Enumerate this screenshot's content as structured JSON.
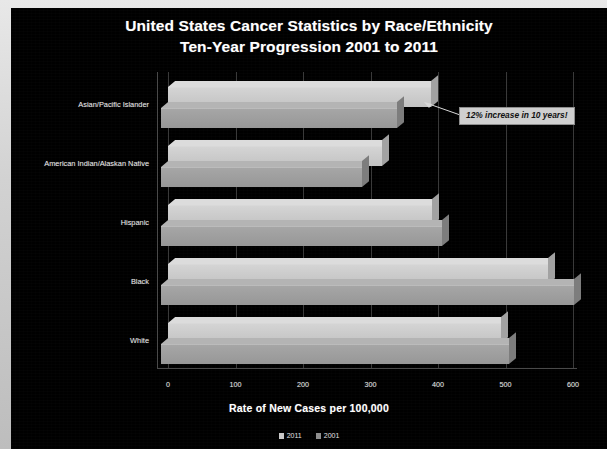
{
  "chart_data": {
    "type": "bar",
    "orientation": "horizontal",
    "title": "United States Cancer Statistics by Race/Ethnicity",
    "subtitle": "Ten-Year Progression 2001 to 2011",
    "xlabel": "Rate of New Cases per 100,000",
    "ylabel": "",
    "xlim": [
      0,
      600
    ],
    "xticks": [
      "0",
      "100",
      "200",
      "300",
      "400",
      "500",
      "600"
    ],
    "grid": true,
    "legend_position": "bottom",
    "categories": [
      "Asian/Pacific Islander",
      "American Indian/Alaskan Native",
      "Hispanic",
      "Black",
      "White"
    ],
    "series": [
      {
        "name": "2011",
        "values": [
          390,
          317,
          391,
          563,
          493
        ],
        "color": "#c9c9c9"
      },
      {
        "name": "2001",
        "values": [
          350,
          298,
          416,
          612,
          516
        ],
        "color": "#8f8f8f"
      }
    ],
    "annotations": [
      {
        "text": "12% increase in 10 years!",
        "target_category": "Asian/Pacific Islander",
        "target_series": "2011"
      }
    ],
    "background_color": "#000000",
    "text_color": "#ffffff"
  },
  "legend": {
    "items": [
      {
        "label": "2011",
        "color": "#c9c9c9"
      },
      {
        "label": "2001",
        "color": "#8f8f8f"
      }
    ]
  }
}
